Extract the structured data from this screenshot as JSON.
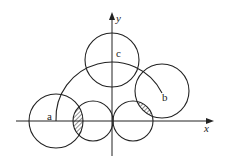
{
  "diagram": {
    "type": "geometry-figure",
    "stroke_color": "#222222",
    "background": "#ffffff",
    "axes": {
      "x_label": "x",
      "y_label": "y",
      "origin": [
        112,
        121
      ],
      "x_range_px": [
        16,
        213
      ],
      "y_range_px": [
        13,
        156
      ]
    },
    "labels": {
      "a": "a",
      "b": "b",
      "c": "c"
    },
    "circles": [
      {
        "id": "circle-a",
        "cx": 56,
        "cy": 121,
        "r": 27
      },
      {
        "id": "circle-left-small",
        "cx": 93,
        "cy": 121,
        "r": 20
      },
      {
        "id": "circle-right-small",
        "cx": 133,
        "cy": 121,
        "r": 20
      },
      {
        "id": "circle-b",
        "cx": 162,
        "cy": 91,
        "r": 27
      },
      {
        "id": "circle-c",
        "cx": 112,
        "cy": 60,
        "r": 27
      }
    ],
    "arc": {
      "from": "a",
      "to": "b",
      "center": [
        112,
        121
      ],
      "r": 56
    },
    "shaded_regions": [
      "lens between circle-a and circle-left-small",
      "lens between circle-right-small and circle-b"
    ]
  }
}
